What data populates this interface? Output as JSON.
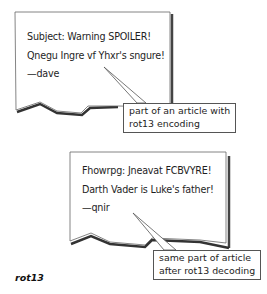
{
  "diagram": {
    "caption": "rot13",
    "encoded_card": {
      "lines": [
        "Subject: Warning SPOILER!",
        "Qnegu Ingre vf Yhxr's sngure!",
        "—dave"
      ],
      "callout": [
        "part of an article with",
        "rot13 encoding"
      ]
    },
    "decoded_card": {
      "lines": [
        "Fhowrpg: Jneavat FCBVYRE!",
        "Darth Vader is Luke's father!",
        "—qnir"
      ],
      "callout": [
        "same part of article",
        "after rot13 decoding"
      ]
    }
  }
}
